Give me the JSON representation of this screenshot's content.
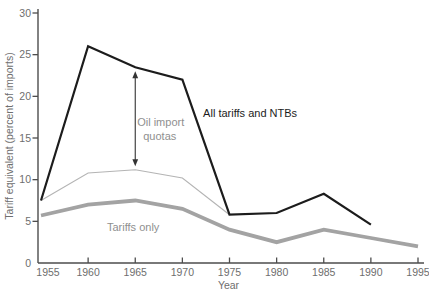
{
  "colors": {
    "background": "#ffffff",
    "axis": "#4d4d4d",
    "tick_label": "#6e6e6e",
    "label_gray": "#8f8f8f",
    "line_black": "#1c1c1c",
    "line_thin_gray": "#b4b4b4",
    "line_thick_gray": "#a3a3a3",
    "arrow": "#333333"
  },
  "chart_data": {
    "type": "line",
    "title": "",
    "xlabel": "Year",
    "ylabel": "Tariff equivalent (percent of imports)",
    "x": [
      1955,
      1960,
      1965,
      1970,
      1975,
      1980,
      1985,
      1990,
      1995
    ],
    "xtick_labels": [
      "1955",
      "1960",
      "1965",
      "1970",
      "1975",
      "1980",
      "1985",
      "1990",
      "1995"
    ],
    "yticks": [
      0,
      5,
      10,
      15,
      20,
      25,
      30
    ],
    "ytick_labels": [
      "0",
      "5",
      "10",
      "15",
      "20",
      "25",
      "30"
    ],
    "ylim": [
      0,
      30
    ],
    "xlim": [
      1955,
      1995
    ],
    "grid": false,
    "legend_position": "inline-labels",
    "series": [
      {
        "id": "tariffs-only",
        "name": "Tariffs only",
        "color_key": "line_thick_gray",
        "values": [
          5.7,
          7.0,
          7.5,
          6.5,
          4.0,
          2.5,
          4.0,
          3.0,
          2.0
        ]
      },
      {
        "id": "all-excluding-oil-quotas",
        "name": "All tariffs and NTBs excluding oil import quotas",
        "color_key": "line_thin_gray",
        "values": [
          7.5,
          10.8,
          11.2,
          10.2,
          5.8,
          null,
          null,
          null,
          null
        ]
      },
      {
        "id": "all-tariffs-and-ntbs",
        "name": "All tariffs and NTBs",
        "color_key": "line_black",
        "values": [
          7.5,
          26.0,
          23.5,
          22.0,
          5.8,
          6.0,
          8.3,
          4.6,
          null
        ]
      }
    ],
    "annotations": {
      "arrow": {
        "style": "double-headed-vertical",
        "x": 1965,
        "y_from": 11.6,
        "y_to": 23.0
      },
      "labels": [
        {
          "id": "oil-import-quotas-label-line-1",
          "text": "Oil import",
          "x": 1967.7,
          "y": 16.9,
          "anchor": "middle",
          "color_key": "label_gray"
        },
        {
          "id": "oil-import-quotas-label-line-2",
          "text": "quotas",
          "x": 1967.6,
          "y": 15.24,
          "anchor": "middle",
          "color_key": "label_gray"
        },
        {
          "id": "all-tariffs-and-ntbs-label",
          "text": "All tariffs and NTBs",
          "x": 1972.2,
          "y": 18.0,
          "anchor": "start",
          "color_key": "line_black"
        },
        {
          "id": "tariffs-only-label",
          "text": "Tariffs only",
          "x": 1962.0,
          "y": 4.32,
          "anchor": "start",
          "color_key": "label_gray"
        }
      ]
    }
  }
}
